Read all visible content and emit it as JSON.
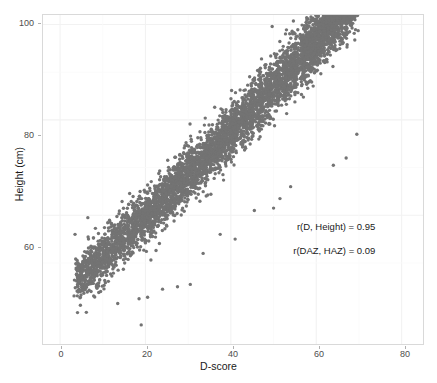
{
  "chart_data": {
    "type": "scatter",
    "title": "",
    "xlabel": "D-score",
    "ylabel": "Height (cm)",
    "xlim": [
      -4,
      85
    ],
    "ylim": [
      33,
      102
    ],
    "xticks": [
      0,
      20,
      40,
      60,
      80
    ],
    "yticks": [
      60,
      80,
      100
    ],
    "xtick_labels": [
      "0",
      "20",
      "40",
      "60",
      "80"
    ],
    "ytick_labels": [
      "60",
      "80",
      "100"
    ],
    "grid": true,
    "legend": "none",
    "point_color": "#737373",
    "point_size": 1.7,
    "panel_background": "#ffffff",
    "gridline_color": "#f2f2f2",
    "annotations": [
      {
        "text": "r(D, Height) = 0.95",
        "x": 69,
        "y": 57.5
      },
      {
        "text": "r(DAZ, HAZ) = 0.09",
        "x": 69,
        "y": 52.5
      }
    ],
    "n_points_approx": 9000,
    "trend": {
      "intercept": 43.0,
      "slope": 0.8,
      "residual_sd": 2.6,
      "x_range": [
        3,
        70
      ]
    },
    "banding": {
      "low_cluster_x": [
        4.0,
        4.6,
        5.2,
        6.0,
        6.6,
        7.2,
        8.0,
        8.6,
        9.2,
        10.0,
        10.6,
        11.2,
        12.0,
        12.6,
        13.2,
        14.0
      ],
      "mid_cluster_x": [
        15,
        16,
        17,
        18,
        19,
        20,
        21,
        22,
        23,
        24,
        25,
        26,
        27,
        28,
        29,
        30,
        31,
        32,
        33,
        34,
        35,
        36,
        37,
        38,
        39,
        40
      ],
      "high_cluster_x": [
        41,
        43,
        45,
        47,
        49,
        51,
        53,
        55,
        57,
        58,
        59,
        60,
        61,
        62,
        63,
        64,
        65,
        66,
        67,
        68,
        69
      ],
      "density_weights": [
        0.22,
        0.34,
        0.44
      ]
    },
    "outliers": [
      {
        "x": 19.0,
        "y": 37.0
      },
      {
        "x": 24.0,
        "y": 44.5
      },
      {
        "x": 13.5,
        "y": 41.5
      },
      {
        "x": 18.5,
        "y": 42.5
      },
      {
        "x": 20.5,
        "y": 42.8
      },
      {
        "x": 30.5,
        "y": 45.5
      },
      {
        "x": 27.5,
        "y": 45.0
      },
      {
        "x": 33.5,
        "y": 52.0
      },
      {
        "x": 41.0,
        "y": 55.0
      },
      {
        "x": 37.5,
        "y": 56.0
      },
      {
        "x": 45.5,
        "y": 61.0
      },
      {
        "x": 50.0,
        "y": 61.5
      },
      {
        "x": 51.5,
        "y": 63.5
      },
      {
        "x": 54.0,
        "y": 66.0
      },
      {
        "x": 64.0,
        "y": 70.5
      },
      {
        "x": 67.0,
        "y": 72.0
      },
      {
        "x": 69.5,
        "y": 77.0
      },
      {
        "x": 3.5,
        "y": 56.0
      },
      {
        "x": 6.5,
        "y": 59.5
      },
      {
        "x": 5.0,
        "y": 48.5
      },
      {
        "x": 4.0,
        "y": 50.5
      },
      {
        "x": 8.5,
        "y": 45.0
      },
      {
        "x": 9.5,
        "y": 44.0
      },
      {
        "x": 56.5,
        "y": 88.0
      },
      {
        "x": 52.0,
        "y": 85.0
      },
      {
        "x": 48.5,
        "y": 80.5
      },
      {
        "x": 44.0,
        "y": 77.0
      },
      {
        "x": 40.0,
        "y": 73.5
      },
      {
        "x": 35.0,
        "y": 69.0
      },
      {
        "x": 31.0,
        "y": 66.0
      },
      {
        "x": 26.0,
        "y": 62.5
      },
      {
        "x": 22.0,
        "y": 58.0
      }
    ]
  },
  "axes": {
    "x_title": "D-score",
    "y_title": "Height (cm)"
  },
  "annotations": {
    "corr_d_height": "r(D, Height) = 0.95",
    "corr_daz_haz": "r(DAZ, HAZ) = 0.09"
  },
  "ticks": {
    "y": [
      "100",
      "80",
      "60"
    ],
    "x": [
      "0",
      "20",
      "40",
      "60",
      "80"
    ]
  }
}
